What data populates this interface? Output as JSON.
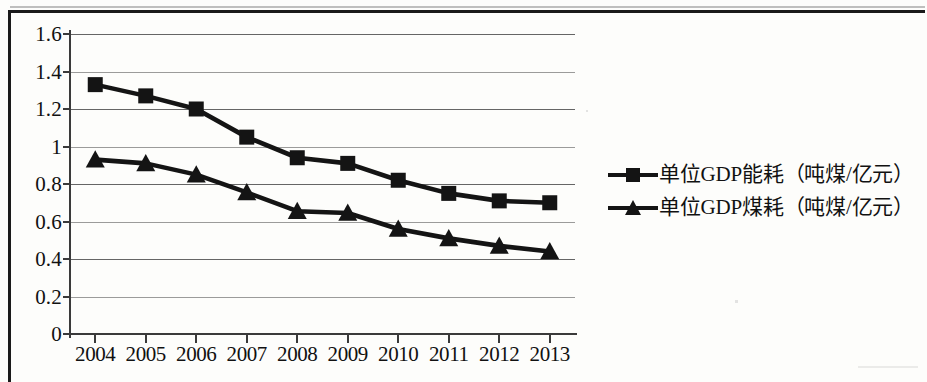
{
  "chart_data": {
    "type": "line",
    "title": "",
    "subtitle": "",
    "xlabel": "",
    "ylabel": "",
    "grid": true,
    "legend_position": "right",
    "categories": [
      "2004",
      "2005",
      "2006",
      "2007",
      "2008",
      "2009",
      "2010",
      "2011",
      "2012",
      "2013"
    ],
    "x_tick_labels": [
      "2004",
      "2005",
      "2006",
      "2007",
      "2008",
      "2009",
      "2010",
      "2011",
      "2012",
      "2013"
    ],
    "y_tick_labels": [
      "0",
      "0.2",
      "0.4",
      "0.6",
      "0.8",
      "1",
      "1.2",
      "1.4",
      "1.6"
    ],
    "y_tick_values": [
      0,
      0.2,
      0.4,
      0.6,
      0.8,
      1,
      1.2,
      1.4,
      1.6
    ],
    "ylim": [
      0,
      1.6
    ],
    "series": [
      {
        "name": "单位GDP能耗（吨煤/亿元）",
        "marker": "square",
        "color": "#141414",
        "values": [
          1.33,
          1.27,
          1.2,
          1.05,
          0.94,
          0.91,
          0.82,
          0.75,
          0.71,
          0.7
        ]
      },
      {
        "name": "单位GDP煤耗（吨煤/亿元）",
        "marker": "triangle",
        "color": "#141414",
        "values": [
          0.93,
          0.91,
          0.85,
          0.755,
          0.655,
          0.645,
          0.56,
          0.51,
          0.47,
          0.44
        ]
      }
    ]
  },
  "legend": {
    "items": [
      {
        "label": "单位GDP能耗（吨煤/亿元）",
        "marker": "square"
      },
      {
        "label": "单位GDP煤耗（吨煤/亿元）",
        "marker": "triangle"
      }
    ]
  },
  "colors": {
    "series": "#141414",
    "grid": "#4a4a4a",
    "axis": "#3a3a3a",
    "text": "#111111",
    "background": "#fdfdfb",
    "frame": "#1a1a1a"
  }
}
